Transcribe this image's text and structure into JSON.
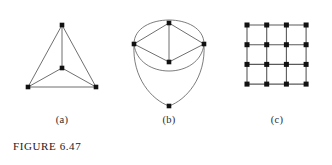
{
  "figure": {
    "caption": "FIGURE  6.47",
    "background_color": "#ffffff",
    "edge_color": "#4a4a4a",
    "vertex_color": "#111111",
    "panels": [
      {
        "id": "a",
        "sublabel": "(a)",
        "name": "planar-k4-graph",
        "description": "Triangle with a central vertex joined to all three corners",
        "vertex_count": 4,
        "edge_count": 6,
        "vertices": [
          {
            "name": "apex",
            "x": 62,
            "y": 25
          },
          {
            "name": "bottom-left",
            "x": 28,
            "y": 87
          },
          {
            "name": "bottom-right",
            "x": 96,
            "y": 87
          },
          {
            "name": "center",
            "x": 62,
            "y": 68
          }
        ],
        "edges": [
          {
            "from": "apex",
            "to": "bottom-left",
            "type": "line"
          },
          {
            "from": "apex",
            "to": "bottom-right",
            "type": "line"
          },
          {
            "from": "bottom-left",
            "to": "bottom-right",
            "type": "line"
          },
          {
            "from": "apex",
            "to": "center",
            "type": "line"
          },
          {
            "from": "center",
            "to": "bottom-left",
            "type": "line"
          },
          {
            "from": "center",
            "to": "bottom-right",
            "type": "line"
          }
        ]
      },
      {
        "id": "b",
        "sublabel": "(b)",
        "name": "diamond-with-arcs-graph",
        "description": "Diamond with vertical middle edge, outer arcs and a pendant bottom vertex",
        "vertex_count": 5,
        "edge_count": 9,
        "vertices": [
          {
            "name": "top",
            "x": 169,
            "y": 23
          },
          {
            "name": "left",
            "x": 134,
            "y": 44
          },
          {
            "name": "right",
            "x": 204,
            "y": 44
          },
          {
            "name": "inner-bottom",
            "x": 169,
            "y": 62
          },
          {
            "name": "bottom",
            "x": 169,
            "y": 106
          }
        ],
        "edges": [
          {
            "from": "left",
            "to": "top",
            "type": "line"
          },
          {
            "from": "top",
            "to": "right",
            "type": "line"
          },
          {
            "from": "left",
            "to": "inner-bottom",
            "type": "line"
          },
          {
            "from": "inner-bottom",
            "to": "right",
            "type": "line"
          },
          {
            "from": "top",
            "to": "inner-bottom",
            "type": "line"
          },
          {
            "from": "left",
            "to": "right",
            "type": "arc-over-top"
          },
          {
            "from": "left",
            "to": "right",
            "type": "arc-under"
          },
          {
            "from": "left",
            "to": "bottom",
            "type": "arc-left"
          },
          {
            "from": "right",
            "to": "bottom",
            "type": "arc-right"
          }
        ]
      },
      {
        "id": "c",
        "sublabel": "(c)",
        "name": "grid-lattice-graph",
        "description": "4 by 4 square lattice grid graph (3 by 3 cells)",
        "rows": 4,
        "columns": 4,
        "vertex_count": 16,
        "edge_count": 24,
        "origin": {
          "x": 247,
          "y": 25
        },
        "spacing": 19.7
      }
    ]
  }
}
